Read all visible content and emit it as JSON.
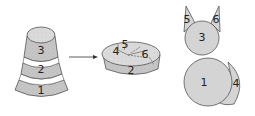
{
  "diagram": {
    "colors": {
      "fill": "#c9c9c9",
      "fill_light": "#dcdcdc",
      "stroke": "#555555",
      "band": "#ffffff"
    },
    "stack": {
      "labels": [
        "1",
        "2",
        "3"
      ]
    },
    "arrow": {
      "direction": "right"
    },
    "bowl": {
      "labels": [
        "2",
        "4",
        "5",
        "6"
      ]
    },
    "cat": {
      "labels": {
        "body": "1",
        "head": "3",
        "tail": "4",
        "left_ear": "5",
        "right_ear": "6"
      }
    }
  }
}
